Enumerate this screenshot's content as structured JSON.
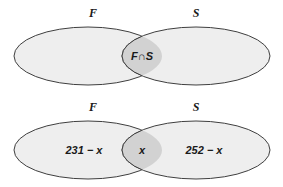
{
  "figure": {
    "background_color": "#ffffff",
    "ellipse_fill": "#eeeeee",
    "intersection_fill": "#d2d2d2",
    "stroke_color": "#3f3f3f"
  },
  "diagrams": [
    {
      "id": "top",
      "name": "labeled-intersection-diagram",
      "left_set_label": "F",
      "right_set_label": "S",
      "left_region_label": "",
      "intersection_label": "F∩S",
      "right_region_label": ""
    },
    {
      "id": "bottom",
      "name": "numeric-counts-diagram",
      "left_set_label": "F",
      "right_set_label": "S",
      "left_region_label": "231 − x",
      "intersection_label": "x",
      "right_region_label": "252 − x"
    }
  ]
}
